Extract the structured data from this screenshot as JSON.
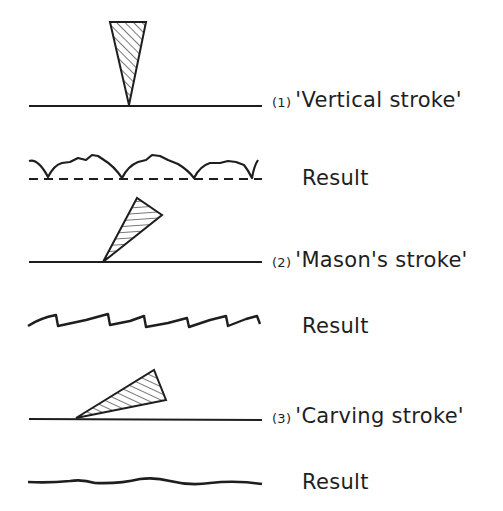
{
  "diagram": {
    "title": "",
    "ink_color": "#1e1e1e",
    "background": "#ffffff",
    "rows": [
      {
        "index": "(1)",
        "stroke_label": "'Vertical stroke'",
        "result_label": "Result",
        "tool": "wedge pointing straight down onto surface",
        "result_shape": "scalloped edge above dashed line"
      },
      {
        "index": "(2)",
        "stroke_label": "'Mason's stroke'",
        "result_label": "Result",
        "tool": "wedge tilted forward at steep angle",
        "result_shape": "sawtooth line"
      },
      {
        "index": "(3)",
        "stroke_label": "'Carving stroke'",
        "result_label": "Result",
        "tool": "wedge at shallow angle",
        "result_shape": "smooth gently wavy line"
      }
    ]
  }
}
